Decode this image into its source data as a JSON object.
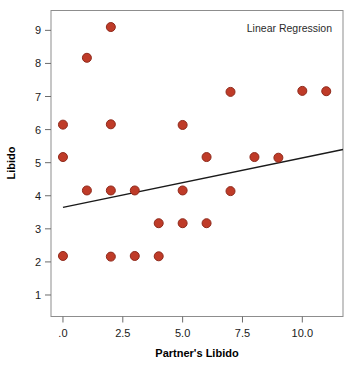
{
  "chart_data": {
    "type": "scatter",
    "title": "",
    "annotation": "Linear Regression",
    "xlabel": "Partner's Libido",
    "ylabel": "Libido",
    "xlim": [
      -0.5,
      11.7
    ],
    "ylim": [
      0.35,
      9.6
    ],
    "grid": false,
    "legend_position": "none",
    "xticks": [
      0,
      2.5,
      5,
      7.5,
      10
    ],
    "xtick_labels": [
      ".0",
      "2.5",
      "5.0",
      "7.5",
      "10.0"
    ],
    "yticks": [
      1,
      2,
      3,
      4,
      5,
      6,
      7,
      8,
      9
    ],
    "ytick_labels": [
      "1",
      "2",
      "3",
      "4",
      "5",
      "6",
      "7",
      "8",
      "9"
    ],
    "marker_color": "#bf3b28",
    "marker_edge_color": "#8f2a1c",
    "marker_size": 9,
    "line_color": "#1a1a1a",
    "points": [
      {
        "x": 0,
        "y": 6.15
      },
      {
        "x": 0,
        "y": 5.17
      },
      {
        "x": 0,
        "y": 2.18
      },
      {
        "x": 1,
        "y": 8.17
      },
      {
        "x": 1,
        "y": 4.16
      },
      {
        "x": 2,
        "y": 9.1
      },
      {
        "x": 2,
        "y": 6.16
      },
      {
        "x": 2,
        "y": 4.16
      },
      {
        "x": 2,
        "y": 2.16
      },
      {
        "x": 3,
        "y": 4.16
      },
      {
        "x": 3,
        "y": 2.18
      },
      {
        "x": 4,
        "y": 3.17
      },
      {
        "x": 4,
        "y": 2.17
      },
      {
        "x": 5,
        "y": 6.14
      },
      {
        "x": 5,
        "y": 4.16
      },
      {
        "x": 5,
        "y": 3.17
      },
      {
        "x": 6,
        "y": 5.17
      },
      {
        "x": 6,
        "y": 3.17
      },
      {
        "x": 7,
        "y": 7.14
      },
      {
        "x": 7,
        "y": 4.14
      },
      {
        "x": 8,
        "y": 5.17
      },
      {
        "x": 9,
        "y": 5.15
      },
      {
        "x": 10,
        "y": 7.17
      },
      {
        "x": 11,
        "y": 7.16
      }
    ],
    "regression_line": {
      "x_start": 0,
      "y_start": 3.65,
      "x_end": 11.7,
      "y_end": 5.4,
      "slope": 0.15,
      "intercept": 3.65
    }
  }
}
